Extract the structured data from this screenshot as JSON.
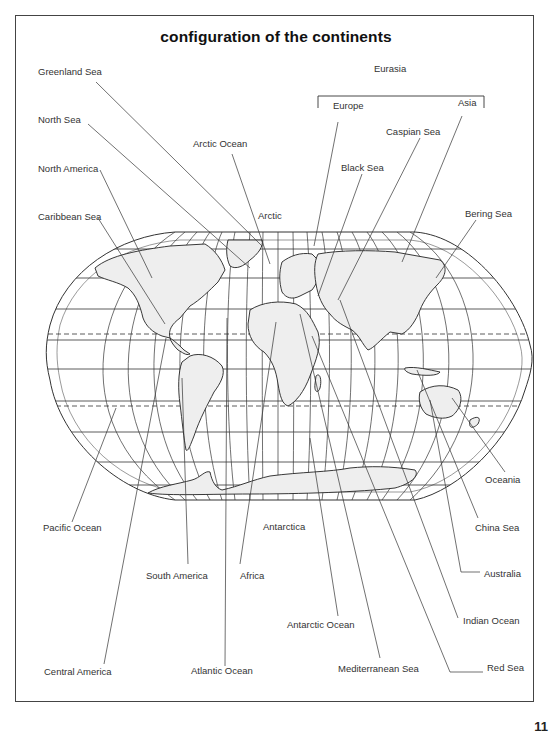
{
  "page": {
    "title": "configuration of the continents",
    "page_number": "11",
    "top_right_mark": "- - - -"
  },
  "map": {
    "projection": "Robinson-style world projection with graticule",
    "theme": {
      "line_color": "#333333",
      "land_fill": "#eeeeee",
      "background": "#ffffff"
    },
    "group_label": {
      "text": "Eurasia",
      "members": [
        "Europe",
        "Asia"
      ]
    },
    "labels": {
      "greenland_sea": "Greenland Sea",
      "north_sea": "North Sea",
      "north_america": "North America",
      "caribbean_sea": "Caribbean Sea",
      "arctic_ocean": "Arctic Ocean",
      "arctic": "Arctic",
      "eurasia": "Eurasia",
      "europe": "Europe",
      "asia": "Asia",
      "caspian_sea": "Caspian Sea",
      "black_sea": "Black Sea",
      "bering_sea": "Bering Sea",
      "oceania": "Oceania",
      "china_sea": "China Sea",
      "australia": "Australia",
      "indian_ocean": "Indian Ocean",
      "red_sea": "Red Sea",
      "mediterranean_sea": "Mediterranean Sea",
      "antarctic_ocean": "Antarctic Ocean",
      "antarctica": "Antarctica",
      "africa": "Africa",
      "south_america": "South America",
      "atlantic_ocean": "Atlantic Ocean",
      "pacific_ocean": "Pacific Ocean",
      "central_america": "Central America"
    }
  }
}
